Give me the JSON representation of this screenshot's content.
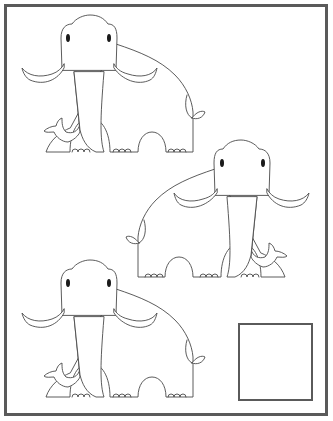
{
  "worksheet": {
    "type": "find-the-different-picture",
    "frame_color": "#5a5a5a",
    "line_color": "#4a4a4a",
    "background": "#ffffff",
    "items": [
      {
        "id": "mammoth-1",
        "subject": "mammoth",
        "facing": "left"
      },
      {
        "id": "mammoth-2",
        "subject": "mammoth",
        "facing": "right"
      },
      {
        "id": "mammoth-3",
        "subject": "mammoth",
        "facing": "left"
      }
    ],
    "answer_box": {
      "label": "",
      "value": ""
    }
  }
}
